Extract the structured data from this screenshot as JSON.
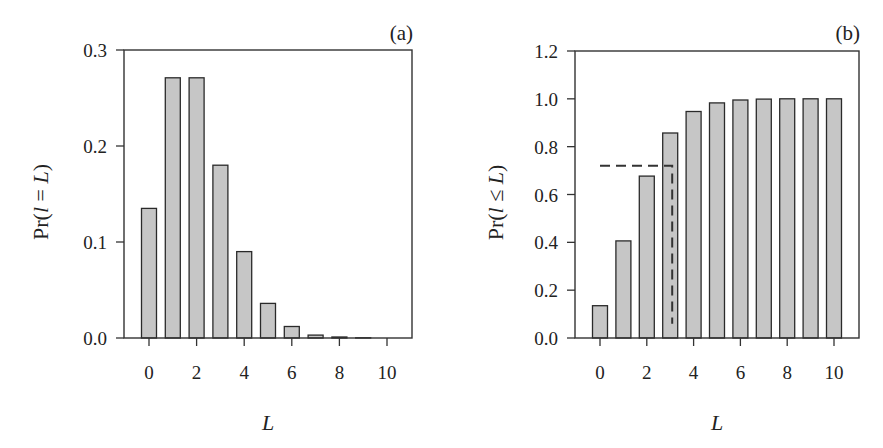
{
  "chart_data": [
    {
      "type": "bar",
      "panel_label": "(a)",
      "title": "",
      "xlabel": "L",
      "ylabel_parts": [
        "Pr(",
        "l",
        " = ",
        "L",
        ")"
      ],
      "ylabel": "Pr(l = L)",
      "categories": [
        0,
        1,
        2,
        3,
        4,
        5,
        6,
        7,
        8,
        9,
        10
      ],
      "values": [
        0.135,
        0.271,
        0.271,
        0.18,
        0.09,
        0.036,
        0.012,
        0.003,
        0.001,
        0.0002,
        4e-05
      ],
      "xticks": [
        "0",
        "2",
        "4",
        "6",
        "8",
        "10"
      ],
      "yticks": [
        "0.0",
        "0.1",
        "0.2",
        "0.3"
      ],
      "ylim": [
        0,
        0.3
      ],
      "xlim": [
        -1,
        11
      ],
      "grid": false,
      "bar_color": "#c6c6c6"
    },
    {
      "type": "bar",
      "panel_label": "(b)",
      "title": "",
      "xlabel": "L",
      "ylabel_parts": [
        "Pr(",
        "l",
        " ≤ ",
        "L",
        ")"
      ],
      "ylabel": "Pr(l ≤ L)",
      "categories": [
        0,
        1,
        2,
        3,
        4,
        5,
        6,
        7,
        8,
        9,
        10
      ],
      "values": [
        0.135,
        0.406,
        0.677,
        0.857,
        0.947,
        0.983,
        0.995,
        0.999,
        1.0,
        1.0,
        1.0
      ],
      "xticks": [
        "0",
        "2",
        "4",
        "6",
        "8",
        "10"
      ],
      "yticks": [
        "0.0",
        "0.2",
        "0.4",
        "0.6",
        "0.8",
        "1.0",
        "1.2"
      ],
      "ylim": [
        0,
        1.2
      ],
      "xlim": [
        -1,
        11
      ],
      "grid": false,
      "bar_color": "#c6c6c6",
      "annotations": [
        {
          "type": "dashed-line",
          "description": "horizontal at y=0.72 from x=0 to x=3, then vertical at x=3 down to y≈0.06",
          "y": 0.72,
          "x_start": 0,
          "x_end": 3,
          "y_end": 0.06
        }
      ]
    }
  ]
}
